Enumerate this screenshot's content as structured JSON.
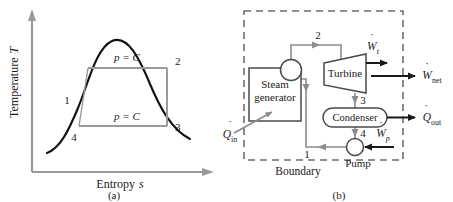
{
  "figure": {
    "panels": [
      {
        "id": "a",
        "caption": "(a)",
        "type": "ts-diagram",
        "axes": {
          "y_label": "Temperature T",
          "y_label_symbol": "T",
          "x_label": "Entropy s",
          "x_label_symbol": "s"
        },
        "process_labels": [
          {
            "name": "upper-isobar",
            "text": "p = C"
          },
          {
            "name": "lower-isobar",
            "text": "p = C"
          }
        ],
        "state_points": [
          {
            "id": "1",
            "label": "1"
          },
          {
            "id": "2",
            "label": "2"
          },
          {
            "id": "3",
            "label": "3"
          },
          {
            "id": "4",
            "label": "4"
          }
        ]
      },
      {
        "id": "b",
        "caption": "(b)",
        "type": "rankine-schematic",
        "boundary_label": "Boundary",
        "components": [
          {
            "name": "steam-generator",
            "label_line1": "Steam",
            "label_line2": "generator"
          },
          {
            "name": "turbine",
            "label": "Turbine"
          },
          {
            "name": "condenser",
            "label": "Condenser"
          },
          {
            "name": "pump",
            "label": "Pump"
          }
        ],
        "energy_flows": [
          {
            "name": "heat-in",
            "symbol": "Q",
            "subscript": "in",
            "dot": true
          },
          {
            "name": "turbine-work",
            "symbol": "W",
            "subscript": "t",
            "dot": true
          },
          {
            "name": "net-work",
            "symbol": "W",
            "subscript": "net",
            "dot": true
          },
          {
            "name": "heat-out",
            "symbol": "Q",
            "subscript": "out",
            "dot": true
          },
          {
            "name": "pump-work",
            "symbol": "W",
            "subscript": "p",
            "dot": true
          }
        ],
        "state_points": [
          {
            "id": "1",
            "label": "1"
          },
          {
            "id": "2",
            "label": "2"
          },
          {
            "id": "3",
            "label": "3"
          },
          {
            "id": "4",
            "label": "4"
          }
        ]
      }
    ]
  },
  "colors": {
    "ink": "#1a1a1a",
    "curve": "#111111",
    "pipe": "#8c8c8c",
    "axis": "#9a9a9a",
    "boundary": "#6e6e6e",
    "background": "#ffffff"
  }
}
